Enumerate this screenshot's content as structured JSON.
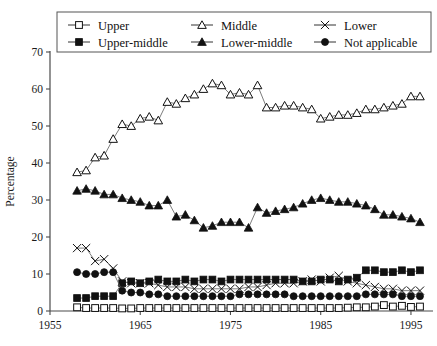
{
  "chart_data": {
    "type": "line",
    "title": "",
    "xlabel": "",
    "ylabel": "Percentage",
    "xlim": [
      1955,
      1997
    ],
    "ylim": [
      0,
      70
    ],
    "xticks": [
      1955,
      1965,
      1975,
      1985,
      1995
    ],
    "yticks": [
      0,
      10,
      20,
      30,
      40,
      50,
      60,
      70
    ],
    "grid": false,
    "legend_position": "top",
    "x": [
      1958,
      1959,
      1960,
      1961,
      1962,
      1963,
      1964,
      1965,
      1966,
      1967,
      1968,
      1969,
      1970,
      1971,
      1972,
      1973,
      1974,
      1975,
      1976,
      1977,
      1978,
      1979,
      1980,
      1981,
      1982,
      1983,
      1984,
      1985,
      1986,
      1987,
      1988,
      1989,
      1990,
      1991,
      1992,
      1993,
      1994,
      1995,
      1996
    ],
    "series": [
      {
        "name": "Upper",
        "marker": "open-square",
        "values": [
          1.0,
          0.8,
          0.8,
          0.8,
          0.8,
          0.7,
          0.7,
          0.8,
          0.8,
          0.8,
          0.8,
          0.8,
          0.8,
          0.8,
          0.8,
          0.8,
          0.8,
          0.8,
          0.8,
          0.8,
          0.8,
          0.8,
          0.8,
          0.8,
          0.8,
          0.8,
          0.8,
          0.8,
          0.8,
          0.8,
          0.9,
          1.0,
          1.0,
          1.2,
          1.6,
          1.2,
          1.4,
          1.1,
          1.2
        ]
      },
      {
        "name": "Middle",
        "marker": "open-triangle",
        "values": [
          37.5,
          38.0,
          41.5,
          42.0,
          46.5,
          50.5,
          50.0,
          52.0,
          52.5,
          51.5,
          56.5,
          56.0,
          57.5,
          58.5,
          60.0,
          61.5,
          61.0,
          58.5,
          59.0,
          58.5,
          61.0,
          55.0,
          55.0,
          55.5,
          55.5,
          55.0,
          54.5,
          52.0,
          52.5,
          53.0,
          53.0,
          53.5,
          54.5,
          54.5,
          55.0,
          55.5,
          56.0,
          58.0,
          58.0
        ]
      },
      {
        "name": "Lower",
        "marker": "cross",
        "values": [
          17.0,
          17.0,
          13.5,
          14.0,
          11.5,
          8.0,
          7.5,
          7.5,
          7.5,
          7.0,
          6.5,
          6.5,
          6.5,
          6.0,
          6.0,
          6.0,
          6.0,
          6.0,
          6.0,
          6.5,
          6.5,
          7.0,
          7.5,
          7.5,
          7.5,
          8.0,
          8.5,
          8.0,
          9.0,
          9.5,
          8.0,
          7.5,
          7.0,
          6.5,
          6.0,
          6.0,
          5.5,
          5.5,
          5.5
        ]
      },
      {
        "name": "Upper-middle",
        "marker": "filled-square",
        "values": [
          3.5,
          3.5,
          4.0,
          4.0,
          4.0,
          7.5,
          8.0,
          7.5,
          8.0,
          8.5,
          8.0,
          8.0,
          8.5,
          8.0,
          8.5,
          8.5,
          8.0,
          8.5,
          8.5,
          8.5,
          8.5,
          8.5,
          8.5,
          8.5,
          8.5,
          8.0,
          8.0,
          8.5,
          8.5,
          8.0,
          8.5,
          9.0,
          11.0,
          11.0,
          10.5,
          10.5,
          11.0,
          10.5,
          11.0
        ]
      },
      {
        "name": "Lower-middle",
        "marker": "filled-triangle",
        "values": [
          32.5,
          33.0,
          32.5,
          31.5,
          31.5,
          30.5,
          30.0,
          29.5,
          28.5,
          28.5,
          30.0,
          25.5,
          26.0,
          24.5,
          22.5,
          23.0,
          24.0,
          24.0,
          24.0,
          22.5,
          28.0,
          26.5,
          27.0,
          27.5,
          28.0,
          29.0,
          30.0,
          30.5,
          30.0,
          29.5,
          29.5,
          29.0,
          28.5,
          27.5,
          26.0,
          26.0,
          25.5,
          25.0,
          24.0
        ]
      },
      {
        "name": "Not applicable",
        "marker": "filled-circle",
        "values": [
          10.5,
          10.0,
          10.0,
          10.5,
          10.5,
          5.5,
          5.0,
          5.0,
          4.5,
          4.5,
          4.0,
          4.0,
          4.0,
          4.0,
          4.0,
          4.0,
          4.0,
          4.0,
          4.5,
          4.5,
          4.5,
          4.5,
          4.5,
          4.5,
          4.0,
          4.0,
          4.0,
          4.0,
          4.0,
          4.0,
          4.0,
          4.0,
          4.5,
          4.5,
          4.5,
          4.5,
          4.0,
          4.0,
          4.0
        ]
      }
    ]
  },
  "legend": {
    "items": [
      {
        "label": "Upper",
        "marker": "open-square"
      },
      {
        "label": "Middle",
        "marker": "open-triangle"
      },
      {
        "label": "Lower",
        "marker": "cross"
      },
      {
        "label": "Upper-middle",
        "marker": "filled-square"
      },
      {
        "label": "Lower-middle",
        "marker": "filled-triangle"
      },
      {
        "label": "Not applicable",
        "marker": "filled-circle"
      }
    ]
  },
  "axes": {
    "y_title": "Percentage",
    "y_ticks": [
      "0",
      "10",
      "20",
      "30",
      "40",
      "50",
      "60",
      "70"
    ],
    "x_ticks": [
      "1955",
      "1965",
      "1975",
      "1985",
      "1995"
    ]
  }
}
